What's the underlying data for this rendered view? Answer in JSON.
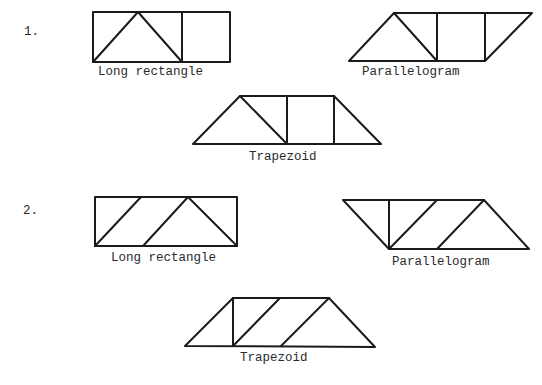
{
  "problems": [
    {
      "number": "1.",
      "figures": [
        {
          "name": "long-rectangle",
          "label": "Long rectangle"
        },
        {
          "name": "parallelogram",
          "label": "Parallelogram"
        },
        {
          "name": "trapezoid",
          "label": "Trapezoid"
        }
      ]
    },
    {
      "number": "2.",
      "figures": [
        {
          "name": "long-rectangle",
          "label": "Long rectangle"
        },
        {
          "name": "parallelogram",
          "label": "Parallelogram"
        },
        {
          "name": "trapezoid",
          "label": "Trapezoid"
        }
      ]
    }
  ],
  "colors": {
    "stroke": "#1a1a1a",
    "text": "#2a2a2a",
    "background": "#ffffff"
  }
}
